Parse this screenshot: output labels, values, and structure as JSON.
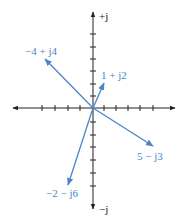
{
  "diagram": {
    "type": "complex-plane-phasors",
    "axes": {
      "positive_imaginary_label": "+j",
      "negative_imaginary_label": "−j",
      "origin": [
        93,
        108
      ],
      "unit_px": 12.2,
      "ticks_per_side_x": 5,
      "ticks_per_side_y": 6
    },
    "colors": {
      "vector": "#4a86c8",
      "axis": "#222222"
    },
    "vectors": [
      {
        "label": "−4 + j4",
        "re": -4,
        "im": 4
      },
      {
        "label": "1 + j2",
        "re": 1,
        "im": 2
      },
      {
        "label": "5 − j3",
        "re": 5,
        "im": -3
      },
      {
        "label": "−2 − j6",
        "re": -2,
        "im": -6
      }
    ]
  }
}
